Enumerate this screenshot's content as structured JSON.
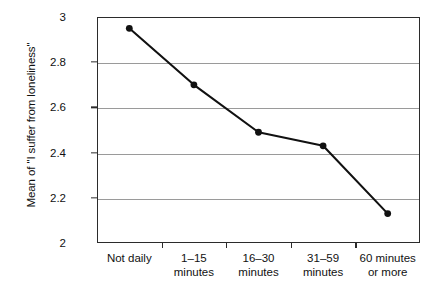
{
  "chart_data": {
    "type": "line",
    "title": "",
    "xlabel": "",
    "ylabel": "Mean of \"I suffer from loneliness\"",
    "categories": [
      "Not daily",
      "1–15\nminutes",
      "16–30\nminutes",
      "31–59\nminutes",
      "60 minutes\nor more"
    ],
    "values": [
      2.95,
      2.7,
      2.49,
      2.43,
      2.13
    ],
    "ylim": [
      2,
      3
    ],
    "yticks": [
      "2",
      "2.2",
      "2.4",
      "2.6",
      "2.8",
      "3"
    ],
    "ytick_values": [
      2,
      2.2,
      2.4,
      2.6,
      2.8,
      3
    ],
    "gridlines": [
      2.2,
      2.4,
      2.6,
      2.8
    ],
    "grid": true,
    "legend": "none",
    "series_color": "#111111",
    "grid_color": "#9a9a9a",
    "axis_color": "#2b2b2b",
    "background_color": "#ffffff"
  }
}
